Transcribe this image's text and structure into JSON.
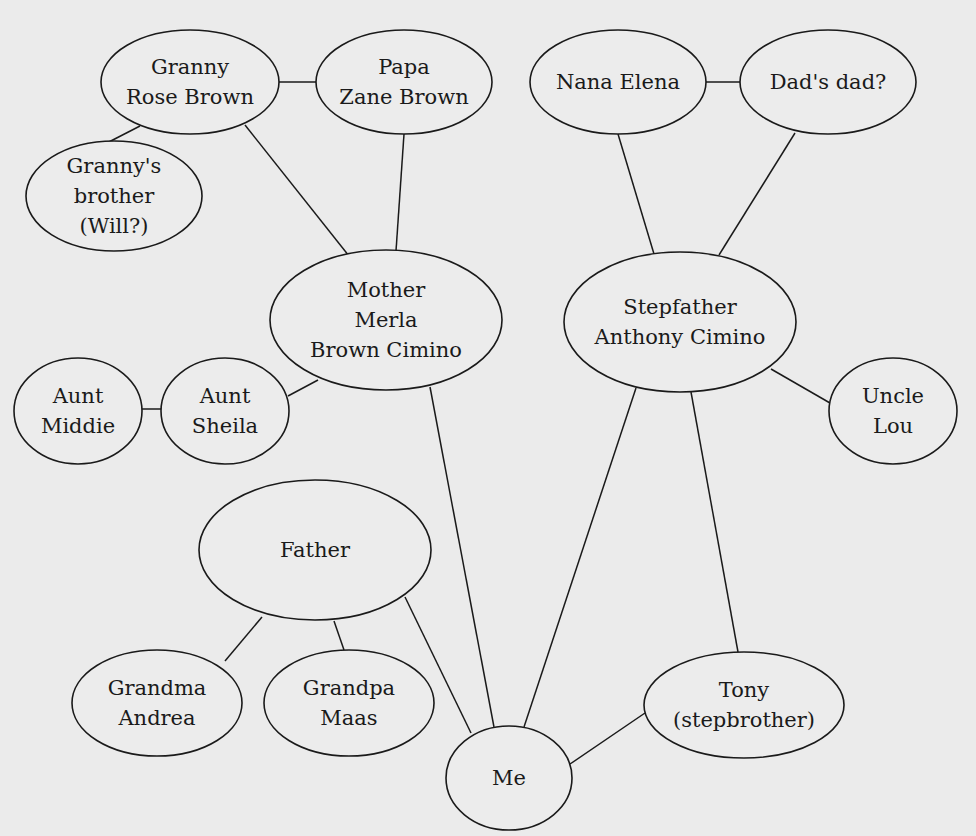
{
  "diagram": {
    "type": "family-relationship-map",
    "nodes": [
      {
        "id": "granny",
        "lines": [
          "Granny",
          "Rose Brown"
        ],
        "cx": 190,
        "cy": 82,
        "rx": 89,
        "ry": 52
      },
      {
        "id": "papa",
        "lines": [
          "Papa",
          "Zane Brown"
        ],
        "cx": 404,
        "cy": 82,
        "rx": 88,
        "ry": 52
      },
      {
        "id": "granny-brother",
        "lines": [
          "Granny's",
          "brother",
          "(Will?)"
        ],
        "cx": 114,
        "cy": 196,
        "rx": 88,
        "ry": 55
      },
      {
        "id": "nana",
        "lines": [
          "Nana Elena"
        ],
        "cx": 618,
        "cy": 82,
        "rx": 88,
        "ry": 52
      },
      {
        "id": "dads-dad",
        "lines": [
          "Dad's dad?"
        ],
        "cx": 828,
        "cy": 82,
        "rx": 88,
        "ry": 52
      },
      {
        "id": "mother",
        "lines": [
          "Mother",
          "Merla",
          "Brown Cimino"
        ],
        "cx": 386,
        "cy": 320,
        "rx": 116,
        "ry": 70
      },
      {
        "id": "stepfather",
        "lines": [
          "Stepfather",
          "Anthony Cimino"
        ],
        "cx": 680,
        "cy": 322,
        "rx": 116,
        "ry": 70
      },
      {
        "id": "aunt-middie",
        "lines": [
          "Aunt",
          "Middie"
        ],
        "cx": 78,
        "cy": 411,
        "rx": 64,
        "ry": 53
      },
      {
        "id": "aunt-sheila",
        "lines": [
          "Aunt",
          "Sheila"
        ],
        "cx": 225,
        "cy": 411,
        "rx": 64,
        "ry": 53
      },
      {
        "id": "uncle-lou",
        "lines": [
          "Uncle",
          "Lou"
        ],
        "cx": 893,
        "cy": 411,
        "rx": 64,
        "ry": 53
      },
      {
        "id": "father",
        "lines": [
          "Father"
        ],
        "cx": 315,
        "cy": 550,
        "rx": 116,
        "ry": 70
      },
      {
        "id": "grandma-andrea",
        "lines": [
          "Grandma",
          "Andrea"
        ],
        "cx": 157,
        "cy": 703,
        "rx": 85,
        "ry": 53
      },
      {
        "id": "grandpa-maas",
        "lines": [
          "Grandpa",
          "Maas"
        ],
        "cx": 349,
        "cy": 703,
        "rx": 85,
        "ry": 53
      },
      {
        "id": "me",
        "lines": [
          "Me"
        ],
        "cx": 509,
        "cy": 778,
        "rx": 63,
        "ry": 52
      },
      {
        "id": "tony",
        "lines": [
          "Tony",
          "(stepbrother)"
        ],
        "cx": 744,
        "cy": 705,
        "rx": 100,
        "ry": 53
      }
    ],
    "edges": [
      {
        "from": "granny",
        "to": "papa",
        "x1": 279,
        "y1": 82,
        "x2": 316,
        "y2": 82
      },
      {
        "from": "granny",
        "to": "granny-brother",
        "x1": 140,
        "y1": 126,
        "x2": 103,
        "y2": 145
      },
      {
        "from": "granny",
        "to": "mother",
        "x1": 245,
        "y1": 125,
        "x2": 349,
        "y2": 256
      },
      {
        "from": "papa",
        "to": "mother",
        "x1": 404,
        "y1": 134,
        "x2": 396,
        "y2": 251
      },
      {
        "from": "nana",
        "to": "dads-dad",
        "x1": 706,
        "y1": 82,
        "x2": 740,
        "y2": 82
      },
      {
        "from": "nana",
        "to": "stepfather",
        "x1": 618,
        "y1": 134,
        "x2": 654,
        "y2": 254
      },
      {
        "from": "dads-dad",
        "to": "stepfather",
        "x1": 795,
        "y1": 133,
        "x2": 719,
        "y2": 255
      },
      {
        "from": "aunt-middie",
        "to": "aunt-sheila",
        "x1": 142,
        "y1": 409,
        "x2": 161,
        "y2": 409
      },
      {
        "from": "aunt-sheila",
        "to": "mother",
        "x1": 288,
        "y1": 396,
        "x2": 318,
        "y2": 380
      },
      {
        "from": "stepfather",
        "to": "uncle-lou",
        "x1": 771,
        "y1": 369,
        "x2": 830,
        "y2": 403
      },
      {
        "from": "mother",
        "to": "me",
        "x1": 430,
        "y1": 387,
        "x2": 494,
        "y2": 727
      },
      {
        "from": "stepfather",
        "to": "me",
        "x1": 636,
        "y1": 388,
        "x2": 524,
        "y2": 727
      },
      {
        "from": "stepfather",
        "to": "tony",
        "x1": 691,
        "y1": 392,
        "x2": 738,
        "y2": 652
      },
      {
        "from": "father",
        "to": "grandma-andrea",
        "x1": 262,
        "y1": 617,
        "x2": 225,
        "y2": 661
      },
      {
        "from": "father",
        "to": "grandpa-maas",
        "x1": 334,
        "y1": 621,
        "x2": 344,
        "y2": 650
      },
      {
        "from": "father",
        "to": "me",
        "x1": 405,
        "y1": 597,
        "x2": 471,
        "y2": 733
      },
      {
        "from": "me",
        "to": "tony",
        "x1": 570,
        "y1": 764,
        "x2": 645,
        "y2": 713
      }
    ],
    "colors": {
      "background": "#ebebeb",
      "stroke": "#1a1a1a",
      "text": "#1a1a1a"
    }
  }
}
